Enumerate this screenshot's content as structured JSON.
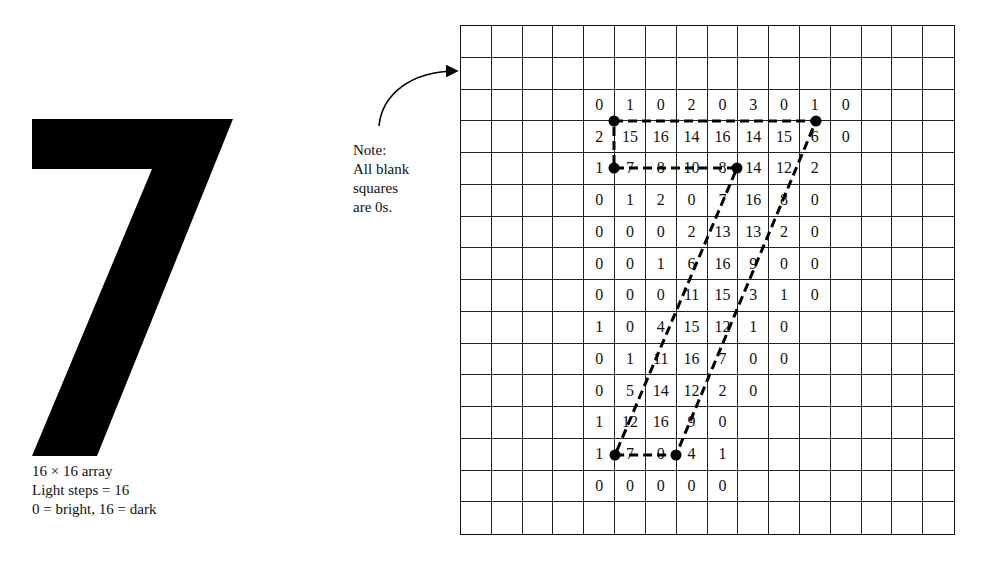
{
  "figure": {
    "glyph": "7",
    "glyph_color": "#000000",
    "caption": {
      "line1": "16 × 16 array",
      "line2": "Light steps = 16",
      "line3": "0 = bright, 16 = dark"
    },
    "note": {
      "line1": "Note:",
      "line2": "All blank",
      "line3": "squares",
      "line4": "are 0s."
    },
    "grid": {
      "rows": 16,
      "cols": 16,
      "line_color": "#222222",
      "values": [
        [
          "",
          "",
          "",
          "",
          "",
          "",
          "",
          "",
          "",
          "",
          "",
          "",
          "",
          "",
          "",
          ""
        ],
        [
          "",
          "",
          "",
          "",
          "",
          "",
          "",
          "",
          "",
          "",
          "",
          "",
          "",
          "",
          "",
          ""
        ],
        [
          "",
          "",
          "",
          "",
          "0",
          "1",
          "0",
          "2",
          "0",
          "3",
          "0",
          "1",
          "0",
          "",
          "",
          ""
        ],
        [
          "",
          "",
          "",
          "",
          "2",
          "15",
          "16",
          "14",
          "16",
          "14",
          "15",
          "6",
          "0",
          "",
          "",
          ""
        ],
        [
          "",
          "",
          "",
          "",
          "1",
          "7",
          "8",
          "10",
          "8",
          "14",
          "12",
          "2",
          "",
          "",
          "",
          ""
        ],
        [
          "",
          "",
          "",
          "",
          "0",
          "1",
          "2",
          "0",
          "7",
          "16",
          "8",
          "0",
          "",
          "",
          "",
          ""
        ],
        [
          "",
          "",
          "",
          "",
          "0",
          "0",
          "0",
          "2",
          "13",
          "13",
          "2",
          "0",
          "",
          "",
          "",
          ""
        ],
        [
          "",
          "",
          "",
          "",
          "0",
          "0",
          "1",
          "6",
          "16",
          "9",
          "0",
          "0",
          "",
          "",
          "",
          ""
        ],
        [
          "",
          "",
          "",
          "",
          "0",
          "0",
          "0",
          "11",
          "15",
          "3",
          "1",
          "0",
          "",
          "",
          "",
          ""
        ],
        [
          "",
          "",
          "",
          "",
          "1",
          "0",
          "4",
          "15",
          "12",
          "1",
          "0",
          "",
          "",
          "",
          "",
          ""
        ],
        [
          "",
          "",
          "",
          "",
          "0",
          "1",
          "11",
          "16",
          "7",
          "0",
          "0",
          "",
          "",
          "",
          "",
          ""
        ],
        [
          "",
          "",
          "",
          "",
          "0",
          "5",
          "14",
          "12",
          "2",
          "0",
          "",
          "",
          "",
          "",
          "",
          ""
        ],
        [
          "",
          "",
          "",
          "",
          "1",
          "12",
          "16",
          "9",
          "0",
          "",
          "",
          "",
          "",
          "",
          "",
          ""
        ],
        [
          "",
          "",
          "",
          "",
          "1",
          "7",
          "0",
          "4",
          "1",
          "",
          "",
          "",
          "",
          "",
          "",
          ""
        ],
        [
          "",
          "",
          "",
          "",
          "0",
          "0",
          "0",
          "0",
          "0",
          "",
          "",
          "",
          "",
          "",
          "",
          ""
        ],
        [
          "",
          "",
          "",
          "",
          "",
          "",
          "",
          "",
          "",
          "",
          "",
          "",
          "",
          "",
          "",
          ""
        ]
      ]
    },
    "outline": {
      "style": "dashed",
      "color": "#000000",
      "vertices": [
        [
          614,
          121
        ],
        [
          816,
          121
        ],
        [
          676,
          455
        ],
        [
          615,
          455
        ],
        [
          737,
          168
        ],
        [
          614,
          168
        ]
      ]
    }
  }
}
